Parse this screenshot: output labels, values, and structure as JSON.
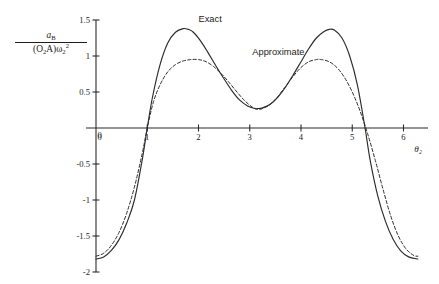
{
  "figure": {
    "background": "#ffffff",
    "ink_color": "#2b2b2b"
  },
  "ylabel_parts": {
    "numerator_var": "a",
    "numerator_sub": "B",
    "denominator": "(O′2A)ω′2",
    "den_open": "(O",
    "den_sub1": "2",
    "den_mid": "A)ω",
    "den_sub2": "2",
    "den_sup2": "2"
  },
  "chart_data": {
    "type": "line",
    "title": "",
    "subtitle": "",
    "xlabel": "θ₂",
    "ylabel": "a_B / ((O₂A)ω₂²)",
    "xlim": [
      0,
      6.4
    ],
    "ylim": [
      -2,
      1.5
    ],
    "xticks": [
      0,
      1,
      2,
      3,
      4,
      5,
      6
    ],
    "xticklabels": [
      "0",
      "1",
      "2",
      "3",
      "4",
      "5",
      "6"
    ],
    "yticks": [
      1.5,
      1,
      0.5,
      0,
      -0.5,
      -1,
      -1.5,
      -2
    ],
    "yticklabels": [
      "1.5",
      "1",
      "0.5",
      "0",
      "-0.5",
      "-1",
      "-1.5",
      "-2"
    ],
    "grid": false,
    "legend_position": "inline-annotation",
    "zero_axis": true,
    "series": [
      {
        "name": "Exact",
        "style": "solid",
        "label_x": 2.0,
        "label_y": 1.47,
        "x": [
          0.0,
          0.15,
          0.3,
          0.45,
          0.6,
          0.75,
          0.9,
          1.0,
          1.1,
          1.25,
          1.4,
          1.55,
          1.7,
          1.8,
          1.9,
          2.05,
          2.2,
          2.35,
          2.5,
          2.65,
          2.8,
          2.95,
          3.1,
          3.15,
          3.25,
          3.4,
          3.55,
          3.7,
          3.85,
          4.0,
          4.15,
          4.3,
          4.45,
          4.55,
          4.65,
          4.8,
          4.95,
          5.1,
          5.25,
          5.35,
          5.5,
          5.65,
          5.8,
          5.95,
          6.1,
          6.28
        ],
        "y": [
          -1.82,
          -1.79,
          -1.7,
          -1.55,
          -1.32,
          -1.0,
          -0.45,
          0.0,
          0.42,
          0.88,
          1.18,
          1.33,
          1.38,
          1.37,
          1.33,
          1.2,
          1.03,
          0.85,
          0.68,
          0.52,
          0.39,
          0.31,
          0.27,
          0.27,
          0.28,
          0.33,
          0.43,
          0.57,
          0.74,
          0.92,
          1.1,
          1.25,
          1.34,
          1.37,
          1.36,
          1.25,
          1.0,
          0.6,
          0.0,
          -0.45,
          -0.95,
          -1.3,
          -1.55,
          -1.71,
          -1.79,
          -1.82
        ]
      },
      {
        "name": "Approximate",
        "style": "dashed",
        "label_x": 3.05,
        "label_y": 1.02,
        "x": [
          0.0,
          0.15,
          0.3,
          0.45,
          0.6,
          0.75,
          0.9,
          1.0,
          1.12,
          1.25,
          1.4,
          1.55,
          1.7,
          1.85,
          2.0,
          2.15,
          2.3,
          2.45,
          2.6,
          2.75,
          2.9,
          3.05,
          3.15,
          3.25,
          3.4,
          3.55,
          3.7,
          3.85,
          4.0,
          4.15,
          4.3,
          4.4,
          4.55,
          4.7,
          4.85,
          5.0,
          5.15,
          5.3,
          5.45,
          5.6,
          5.75,
          5.9,
          6.05,
          6.2,
          6.28
        ],
        "y": [
          -1.78,
          -1.74,
          -1.63,
          -1.45,
          -1.18,
          -0.82,
          -0.36,
          0.0,
          0.36,
          0.6,
          0.78,
          0.88,
          0.93,
          0.95,
          0.95,
          0.92,
          0.85,
          0.75,
          0.63,
          0.5,
          0.38,
          0.29,
          0.26,
          0.27,
          0.33,
          0.44,
          0.58,
          0.72,
          0.84,
          0.92,
          0.95,
          0.95,
          0.92,
          0.84,
          0.7,
          0.5,
          0.24,
          -0.08,
          -0.45,
          -0.85,
          -1.22,
          -1.5,
          -1.68,
          -1.77,
          -1.78
        ]
      }
    ]
  }
}
